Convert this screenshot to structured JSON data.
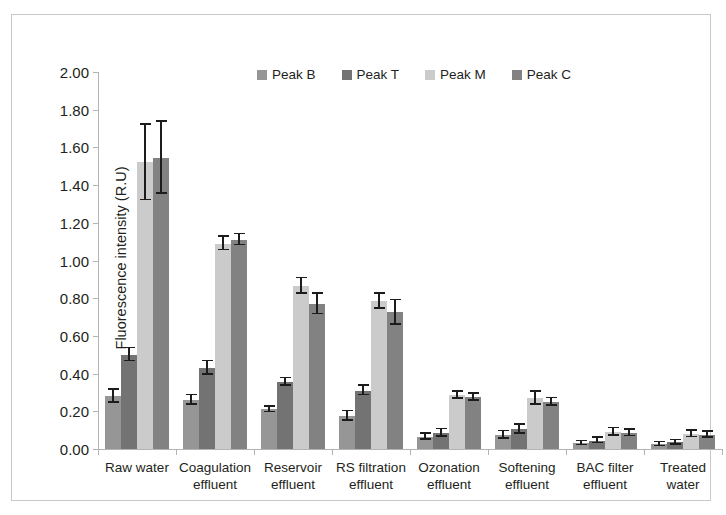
{
  "figure": {
    "top_caption_fragment": "",
    "border_color": "#c9c9c9"
  },
  "chart_data": {
    "type": "bar",
    "title": "",
    "xlabel": "",
    "ylabel": "Fluorescence intensity (R.U)",
    "ylim": [
      0,
      2.0
    ],
    "ytick_step": 0.2,
    "ytick_labels": [
      "0.00",
      "0.20",
      "0.40",
      "0.60",
      "0.80",
      "1.00",
      "1.20",
      "1.40",
      "1.60",
      "1.80",
      "2.00"
    ],
    "grid": false,
    "legend_position": "top-center",
    "error_bars": true,
    "categories": [
      "Raw water",
      "Coagulation effluent",
      "Reservoir effluent",
      "RS filtration effluent",
      "Ozonation effluent",
      "Softening effluent",
      "BAC filter effluent",
      "Treated water"
    ],
    "category_lines": [
      [
        "Raw water",
        ""
      ],
      [
        "Coagulation",
        "effluent"
      ],
      [
        "Reservoir",
        "effluent"
      ],
      [
        "RS filtration",
        "effluent"
      ],
      [
        "Ozonation",
        "effluent"
      ],
      [
        "Softening",
        "effluent"
      ],
      [
        "BAC filter",
        "effluent"
      ],
      [
        "Treated",
        "water"
      ]
    ],
    "series": [
      {
        "name": "Peak B",
        "color": "#969696",
        "values": [
          0.28,
          0.26,
          0.21,
          0.175,
          0.065,
          0.075,
          0.03,
          0.025
        ],
        "errors": [
          0.035,
          0.025,
          0.015,
          0.025,
          0.015,
          0.02,
          0.01,
          0.01
        ]
      },
      {
        "name": "Peak T",
        "color": "#737373",
        "values": [
          0.5,
          0.43,
          0.355,
          0.31,
          0.085,
          0.105,
          0.045,
          0.035
        ],
        "errors": [
          0.035,
          0.035,
          0.02,
          0.025,
          0.02,
          0.025,
          0.015,
          0.012
        ]
      },
      {
        "name": "Peak M",
        "color": "#cbcbcb",
        "values": [
          1.52,
          1.09,
          0.865,
          0.785,
          0.285,
          0.27,
          0.09,
          0.08
        ],
        "errors": [
          0.2,
          0.035,
          0.04,
          0.04,
          0.02,
          0.035,
          0.02,
          0.018
        ]
      },
      {
        "name": "Peak C",
        "color": "#828282",
        "values": [
          1.545,
          1.11,
          0.77,
          0.725,
          0.275,
          0.25,
          0.085,
          0.075
        ],
        "errors": [
          0.19,
          0.03,
          0.055,
          0.065,
          0.018,
          0.02,
          0.018,
          0.015
        ]
      }
    ]
  }
}
